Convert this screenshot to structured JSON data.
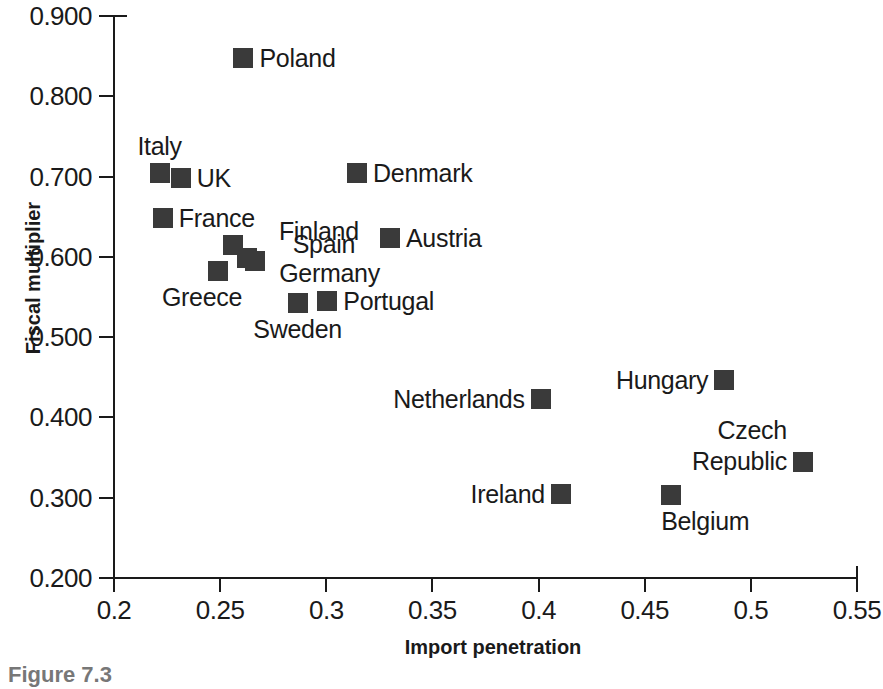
{
  "chart_data": {
    "type": "scatter",
    "title": "",
    "xlabel": "Import penetration",
    "ylabel": "Fiscal multiplier",
    "xlim": [
      0.2,
      0.55
    ],
    "ylim": [
      0.2,
      0.9
    ],
    "xticks": [
      "0.2",
      "0.25",
      "0.3",
      "0.35",
      "0.4",
      "0.45",
      "0.5",
      "0.55"
    ],
    "xtick_values": [
      0.2,
      0.25,
      0.3,
      0.35,
      0.4,
      0.45,
      0.5,
      0.55
    ],
    "yticks": [
      "0.900",
      "0.800",
      "0.700",
      "0.600",
      "0.500",
      "0.400",
      "0.300",
      "0.200"
    ],
    "ytick_values": [
      0.9,
      0.8,
      0.7,
      0.6,
      0.5,
      0.4,
      0.3,
      0.2
    ],
    "grid": false,
    "legend": "none",
    "marker_color": "#3a3a3a",
    "marker_shape": "square",
    "points": [
      {
        "label": "Poland",
        "x": 0.261,
        "y": 0.848,
        "label_pos": "right"
      },
      {
        "label": "Italy",
        "x": 0.2215,
        "y": 0.704,
        "label_pos": "above"
      },
      {
        "label": "UK",
        "x": 0.2315,
        "y": 0.698,
        "label_pos": "right"
      },
      {
        "label": "Denmark",
        "x": 0.3145,
        "y": 0.704,
        "label_pos": "right"
      },
      {
        "label": "France",
        "x": 0.223,
        "y": 0.648,
        "label_pos": "right"
      },
      {
        "label": "Austria",
        "x": 0.33,
        "y": 0.623,
        "label_pos": "right"
      },
      {
        "label": "Finland",
        "x": 0.256,
        "y": 0.615,
        "label_pos": "right-far"
      },
      {
        "label": "Spain",
        "x": 0.2625,
        "y": 0.599,
        "label_pos": "right-far"
      },
      {
        "label": "Greece",
        "x": 0.249,
        "y": 0.582,
        "label_pos": "below-left"
      },
      {
        "label": "Germany",
        "x": 0.2665,
        "y": 0.595,
        "label_pos": "right-low"
      },
      {
        "label": "Sweden",
        "x": 0.2865,
        "y": 0.543,
        "label_pos": "below"
      },
      {
        "label": "Portugal",
        "x": 0.3005,
        "y": 0.545,
        "label_pos": "right"
      },
      {
        "label": "Hungary",
        "x": 0.4875,
        "y": 0.447,
        "label_pos": "left"
      },
      {
        "label": "Netherlands",
        "x": 0.401,
        "y": 0.423,
        "label_pos": "left"
      },
      {
        "label": "Czech Republic",
        "x": 0.5245,
        "y": 0.344,
        "label_pos": "left-two-line"
      },
      {
        "label": "Ireland",
        "x": 0.4105,
        "y": 0.305,
        "label_pos": "left"
      },
      {
        "label": "Belgium",
        "x": 0.4625,
        "y": 0.303,
        "label_pos": "below-right"
      }
    ]
  },
  "caption": {
    "text": "Figure 7.3"
  }
}
